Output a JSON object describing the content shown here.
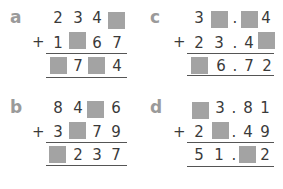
{
  "problems": {
    "a": {
      "label": "a",
      "operator": "+",
      "row1": [
        "2",
        "3",
        "4",
        ""
      ],
      "row2": [
        "1",
        "",
        "6",
        "7"
      ],
      "result": [
        "",
        "7",
        "",
        "4"
      ]
    },
    "b": {
      "label": "b",
      "operator": "+",
      "row1": [
        "8",
        "4",
        "",
        "6"
      ],
      "row2": [
        "3",
        "",
        "7",
        "9"
      ],
      "result": [
        "",
        "2",
        "3",
        "7"
      ]
    },
    "c": {
      "label": "c",
      "operator": "+",
      "row1": [
        "3",
        "",
        ".",
        "",
        "4"
      ],
      "row2": [
        "2",
        "3",
        ".",
        "4",
        ""
      ],
      "result": [
        "",
        "6",
        ".",
        "7",
        "2"
      ]
    },
    "d": {
      "label": "d",
      "operator": "+",
      "row1": [
        "",
        "3",
        ".",
        "8",
        "1"
      ],
      "row2": [
        "2",
        "",
        ".",
        "4",
        "9"
      ],
      "result": [
        "5",
        "1",
        ".",
        "",
        "2"
      ]
    }
  },
  "colors": {
    "blank_box": "#a3a3a3",
    "label": "#9a9a9a",
    "digits": "#3a3a3a"
  }
}
